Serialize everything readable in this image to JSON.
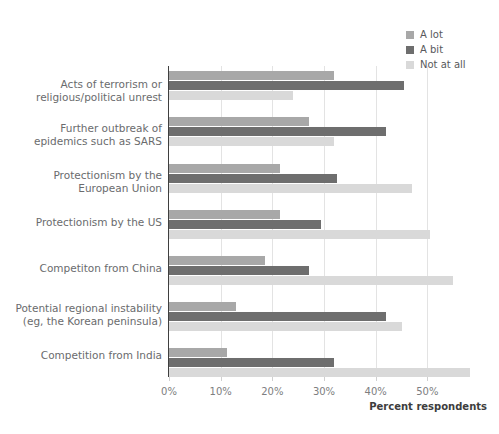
{
  "chart_data": {
    "type": "bar",
    "orientation": "horizontal",
    "title": "",
    "xlabel": "Percent respondents",
    "ylabel": "",
    "xlim": [
      0,
      60
    ],
    "xticks": [
      0,
      10,
      20,
      30,
      40,
      50
    ],
    "xtick_labels": [
      "0%",
      "10%",
      "20%",
      "30%",
      "40%",
      "50%"
    ],
    "grid": true,
    "legend_position": "top-right",
    "categories": [
      "Acts of terrorism or religious/political unrest",
      "Further outbreak of epidemics such as SARS",
      "Protectionism by the European Union",
      "Protectionism by the US",
      "Competiton from China",
      "Potential regional instability (eg, the Korean peninsula)",
      "Competition from India"
    ],
    "category_lines": [
      [
        "Acts of terrorism or",
        "religious/political unrest"
      ],
      [
        "Further outbreak of",
        "epidemics such as SARS"
      ],
      [
        "Protectionism by the",
        "European Union"
      ],
      [
        "Protectionism by the US"
      ],
      [
        "Competiton from China"
      ],
      [
        "Potential regional instability",
        "(eg, the Korean peninsula)"
      ],
      [
        "Competition from India"
      ]
    ],
    "series": [
      {
        "name": "A lot",
        "color": "#a8a8a8",
        "values": [
          32.0,
          27.0,
          21.5,
          21.5,
          18.5,
          13.0,
          11.3
        ]
      },
      {
        "name": "A bit",
        "color": "#6e6e6e",
        "values": [
          45.5,
          42.0,
          32.5,
          29.5,
          27.0,
          42.0,
          32.0
        ]
      },
      {
        "name": "Not at all",
        "color": "#d9d9d9",
        "values": [
          24.0,
          32.0,
          47.0,
          50.5,
          55.0,
          45.0,
          58.3
        ]
      }
    ]
  },
  "legend": {
    "items": [
      {
        "label": "A lot",
        "swatch": "#a8a8a8"
      },
      {
        "label": "A bit",
        "swatch": "#6e6e6e"
      },
      {
        "label": "Not at all",
        "swatch": "#d9d9d9"
      }
    ]
  },
  "axis": {
    "x_title": "Percent respondents"
  }
}
